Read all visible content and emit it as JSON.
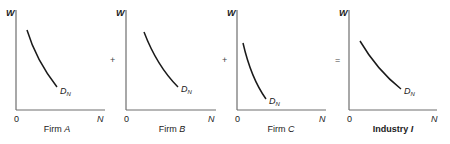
{
  "diagram": {
    "operators": [
      "+",
      "+",
      "="
    ],
    "panels": [
      {
        "id": "firm-a",
        "y_axis_label": "W",
        "x_axis_label": "N",
        "origin_label": "0",
        "curve_label_main": "D",
        "curve_label_sub": "N",
        "caption_prefix": "Firm ",
        "caption_var": "A"
      },
      {
        "id": "firm-b",
        "y_axis_label": "W",
        "x_axis_label": "N",
        "origin_label": "0",
        "curve_label_main": "D",
        "curve_label_sub": "N",
        "caption_prefix": "Firm ",
        "caption_var": "B"
      },
      {
        "id": "firm-c",
        "y_axis_label": "W",
        "x_axis_label": "N",
        "origin_label": "0",
        "curve_label_main": "D",
        "curve_label_sub": "N",
        "caption_prefix": "Firm ",
        "caption_var": "C"
      },
      {
        "id": "industry-i",
        "y_axis_label": "W",
        "x_axis_label": "N",
        "origin_label": "0",
        "curve_label_main": "D",
        "curve_label_sub": "N",
        "caption_prefix": "Industry ",
        "caption_var": "I"
      }
    ]
  }
}
